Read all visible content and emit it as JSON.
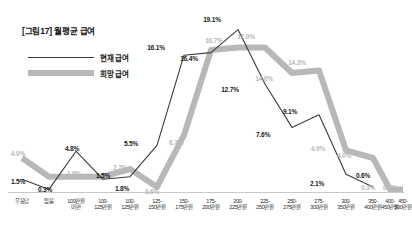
{
  "figure": {
    "title": "[그림17] 월평균 급여",
    "background": "#ffffff"
  },
  "legend": {
    "position": "top-left",
    "items": [
      {
        "label": "현재 급여",
        "color": "#3b3b3b",
        "style": "thin-line"
      },
      {
        "label": "희망 급여",
        "color": "#b8b8b8",
        "style": "thick-line"
      }
    ]
  },
  "chart_data": {
    "type": "line",
    "title": "[그림17] 월평균 급여",
    "xlabel": "",
    "ylabel": "",
    "ylim": [
      0,
      20
    ],
    "grid": false,
    "legend_position": "top-left",
    "categories": [
      "무응답",
      "없음",
      "100만원 미만",
      "100-125만원",
      "100-125만원",
      "125-150만원",
      "150-175만원",
      "175-200만원",
      "200-225만원",
      "225-250만원",
      "250-275만원",
      "275-300만원",
      "300-350만원",
      "350-400만원",
      "400-450만원",
      "450-500만원"
    ],
    "category_lines": [
      [
        "무응답"
      ],
      [
        "없음"
      ],
      [
        "100만원",
        "미만"
      ],
      [
        "100-",
        "125만원"
      ],
      [
        "100-",
        "125만원"
      ],
      [
        "125-",
        "150만원"
      ],
      [
        "150-",
        "175만원"
      ],
      [
        "175-",
        "200만원"
      ],
      [
        "200-",
        "225만원"
      ],
      [
        "225-",
        "250만원"
      ],
      [
        "250-",
        "275만원"
      ],
      [
        "275-",
        "300만원"
      ],
      [
        "300-",
        "350만원"
      ],
      [
        "350-",
        "400만원"
      ],
      [
        "400-",
        "450만원"
      ],
      [
        "450-",
        "500만원"
      ]
    ],
    "series": [
      {
        "name": "현재 급여",
        "color": "#3b3b3b",
        "values": [
          1.5,
          0.3,
          4.8,
          1.5,
          1.8,
          5.5,
          16.1,
          16.4,
          19.1,
          12.7,
          7.6,
          9.1,
          2.1,
          0.6,
          null,
          null
        ],
        "labels": [
          "1.5%",
          "0.3%",
          "4.8%",
          "1.5%",
          "1.8%",
          "5.5%",
          "16.1%",
          "16.4%",
          "19.1%",
          "12.7%",
          "7.6%",
          "9.1%",
          "2.1%",
          "0.6%",
          "",
          ""
        ]
      },
      {
        "name": "희망 급여",
        "color": "#b8b8b8",
        "values": [
          4.0,
          1.8,
          1.8,
          1.8,
          2.7,
          0.6,
          6.7,
          16.7,
          17.0,
          17.0,
          14.0,
          14.3,
          4.9,
          4.0,
          0.3,
          0.3
        ],
        "labels": [
          "4.0%",
          "1.8%",
          "",
          "",
          "2.7%",
          "0.6%",
          "6.7%",
          "16.7%",
          "17.0%",
          "17.0%",
          "14.0%",
          "14.3%",
          "4.9%",
          "4.0%",
          "0.3%",
          "0.3%"
        ]
      }
    ]
  },
  "data_labels": [
    {
      "text": "4.0%",
      "series": "desired",
      "x": 18,
      "y": 150
    },
    {
      "text": "1.5%",
      "series": "current",
      "x": 18,
      "y": 178
    },
    {
      "text": "0.3%",
      "series": "current",
      "x": 45,
      "y": 186
    },
    {
      "text": "1.8%",
      "series": "desired",
      "x": 74,
      "y": 170
    },
    {
      "text": "4.8%",
      "series": "current",
      "x": 72,
      "y": 145
    },
    {
      "text": "1.5%",
      "series": "current",
      "x": 103,
      "y": 172
    },
    {
      "text": "2.7%",
      "series": "desired",
      "x": 120,
      "y": 164
    },
    {
      "text": "1.8%",
      "series": "current",
      "x": 122,
      "y": 185
    },
    {
      "text": "5.5%",
      "series": "current",
      "x": 131,
      "y": 140
    },
    {
      "text": "0.6%",
      "series": "desired",
      "x": 152,
      "y": 188
    },
    {
      "text": "6.7%",
      "series": "desired",
      "x": 176,
      "y": 139
    },
    {
      "text": "16.1%",
      "series": "current",
      "x": 156,
      "y": 44
    },
    {
      "text": "16.4%",
      "series": "current",
      "x": 189,
      "y": 55
    },
    {
      "text": "19.1%",
      "series": "current",
      "x": 212,
      "y": 16
    },
    {
      "text": "16.7%",
      "series": "desired",
      "x": 214,
      "y": 37
    },
    {
      "text": "17.0%",
      "series": "desired",
      "x": 246,
      "y": 33
    },
    {
      "text": "12.7%",
      "series": "current",
      "x": 230,
      "y": 86
    },
    {
      "text": "14.0%",
      "series": "desired",
      "x": 264,
      "y": 75
    },
    {
      "text": "14.3%",
      "series": "desired",
      "x": 297,
      "y": 59
    },
    {
      "text": "7.6%",
      "series": "current",
      "x": 263,
      "y": 131
    },
    {
      "text": "9.1%",
      "series": "current",
      "x": 290,
      "y": 108
    },
    {
      "text": "4.9%",
      "series": "desired",
      "x": 318,
      "y": 145
    },
    {
      "text": "4.0%",
      "series": "desired",
      "x": 344,
      "y": 152
    },
    {
      "text": "2.1%",
      "series": "current",
      "x": 317,
      "y": 180
    },
    {
      "text": "0.6%",
      "series": "current",
      "x": 363,
      "y": 172
    },
    {
      "text": "0.3%",
      "series": "desired",
      "x": 368,
      "y": 184
    },
    {
      "text": "0.3%",
      "series": "desired",
      "x": 390,
      "y": 184
    }
  ],
  "axis": {
    "tick_x": [
      22,
      49,
      76,
      103,
      130,
      157,
      184,
      211,
      238,
      265,
      292,
      319,
      346,
      373,
      390,
      403
    ]
  }
}
